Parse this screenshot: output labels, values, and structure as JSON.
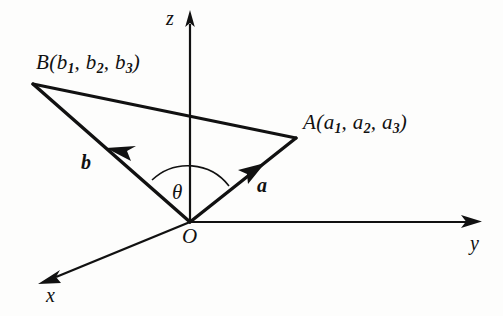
{
  "figure": {
    "background_color": "#fdfdfc",
    "ink_color": "#111111"
  },
  "axes": [
    {
      "name": "z",
      "label": "z",
      "direction": "up"
    },
    {
      "name": "y",
      "label": "y",
      "direction": "right"
    },
    {
      "name": "x",
      "label": "x",
      "direction": "down-left"
    }
  ],
  "origin": {
    "label": "O"
  },
  "points": [
    {
      "name": "A",
      "letter": "A",
      "open_paren": "(",
      "components": [
        {
          "base": "a",
          "sub": "1"
        },
        {
          "base": "a",
          "sub": "2"
        },
        {
          "base": "a",
          "sub": "3"
        }
      ],
      "close_paren": ")",
      "separator": ", ",
      "full_text": "A(a1, a2, a3)"
    },
    {
      "name": "B",
      "letter": "B",
      "open_paren": "(",
      "components": [
        {
          "base": "b",
          "sub": "1"
        },
        {
          "base": "b",
          "sub": "2"
        },
        {
          "base": "b",
          "sub": "3"
        }
      ],
      "close_paren": ")",
      "separator": ", ",
      "full_text": "B(b1, b2, b3)"
    }
  ],
  "vectors": [
    {
      "name": "a",
      "label": "a",
      "from": "O",
      "to": "A"
    },
    {
      "name": "b",
      "label": "b",
      "from": "O",
      "to": "B"
    }
  ],
  "angle": {
    "label": "θ",
    "between": "a and b",
    "vertex": "O"
  },
  "segments": [
    {
      "name": "AB",
      "from": "A",
      "to": "B"
    }
  ]
}
